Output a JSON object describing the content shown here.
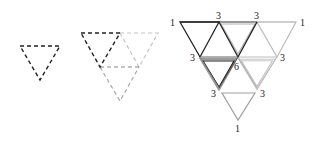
{
  "figure": {
    "panels": [
      {
        "id": "single-dashed-triangle",
        "description": "single inverted dashed triangle"
      },
      {
        "id": "dashed-triangle-group",
        "description": "dark dashed inverted triangle with light dashed neighboring triangles"
      },
      {
        "id": "counted-triangle-grid",
        "description": "large inverted triangle subdivided into smaller triangles with vertex counts"
      }
    ],
    "vertex_labels": {
      "top_left": "1",
      "top_mid_left": "3",
      "top_mid_right": "3",
      "top_right": "1",
      "mid_left": "3",
      "center": "6",
      "mid_right": "3",
      "low_left": "3",
      "low_right": "3",
      "bottom": "1"
    },
    "colors": {
      "dark": "#222222",
      "medium": "#888888",
      "light": "#b8b8b8"
    }
  }
}
